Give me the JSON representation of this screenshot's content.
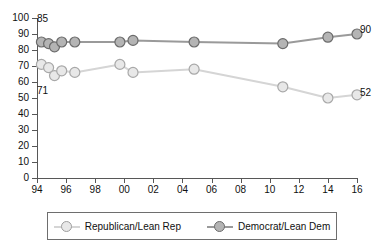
{
  "chart_data": {
    "type": "line",
    "title": "",
    "subtitle": "",
    "xlabel": "",
    "ylabel": "",
    "xlim": [
      94,
      116
    ],
    "ylim": [
      0,
      100
    ],
    "grid": false,
    "legend_position": "bottom",
    "y_ticks": [
      0,
      10,
      20,
      30,
      40,
      50,
      60,
      70,
      80,
      90,
      100
    ],
    "y_tick_labels": [
      "0",
      "10",
      "20",
      "30",
      "40",
      "50",
      "60",
      "70",
      "80",
      "90",
      "100"
    ],
    "x_ticks": [
      94,
      96,
      98,
      100,
      102,
      104,
      106,
      108,
      110,
      112,
      114,
      116
    ],
    "x_tick_labels": [
      "94",
      "96",
      "98",
      "00",
      "02",
      "04",
      "06",
      "08",
      "10",
      "12",
      "14",
      "16"
    ],
    "series": [
      {
        "name": "Democrat/Lean Dem",
        "color": "#9a9a9a",
        "marker_fill": "#b4b4b4",
        "marker_edge": "#6b6b6b",
        "x": [
          94.3,
          94.8,
          95.2,
          95.7,
          96.6,
          99.7,
          100.6,
          104.8,
          110.9,
          114.0,
          116.0
        ],
        "values": [
          85,
          84,
          82,
          85,
          85,
          85,
          86,
          85,
          84,
          88,
          90
        ],
        "start_label": "85",
        "end_label": "90"
      },
      {
        "name": "Republican/Lean Rep",
        "color": "#d5d5d5",
        "marker_fill": "#e8e8e8",
        "marker_edge": "#a8a8a8",
        "x": [
          94.3,
          94.8,
          95.2,
          95.7,
          96.6,
          99.7,
          100.6,
          104.8,
          110.9,
          114.0,
          116.0
        ],
        "values": [
          71,
          69,
          64,
          67,
          66,
          71,
          66,
          68,
          57,
          50,
          52
        ],
        "start_label": "71",
        "end_label": "52"
      }
    ],
    "annotations": [
      {
        "text": "85",
        "series": "Democrat/Lean Dem",
        "position": "start-above"
      },
      {
        "text": "71",
        "series": "Republican/Lean Rep",
        "position": "start-below"
      },
      {
        "text": "90",
        "series": "Democrat/Lean Dem",
        "position": "end-right"
      },
      {
        "text": "52",
        "series": "Republican/Lean Rep",
        "position": "end-right"
      }
    ]
  },
  "legend": {
    "items": [
      {
        "label": "Republican/Lean Rep",
        "marker_fill": "#e8e8e8",
        "marker_edge": "#9e9e9e",
        "line_color": "#d5d5d5"
      },
      {
        "label": "Democrat/Lean Dem",
        "marker_fill": "#b4b4b4",
        "marker_edge": "#6b6b6b",
        "line_color": "#9a9a9a"
      }
    ]
  }
}
